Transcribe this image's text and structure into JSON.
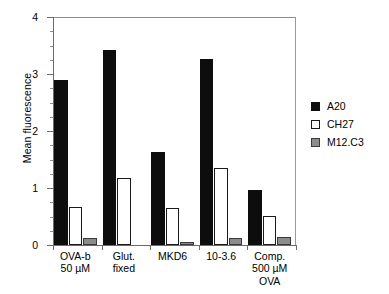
{
  "chart_data": {
    "type": "bar",
    "title": "",
    "xlabel": "",
    "ylabel": "Mean fluorescence",
    "ylim": [
      0,
      4
    ],
    "yticks": [
      0,
      1,
      2,
      3,
      4
    ],
    "ytick_labels": [
      "0",
      "1",
      "2",
      "3",
      "4"
    ],
    "yminor_step": 0.25,
    "grid": false,
    "legend_position": "right",
    "categories": [
      "OVA-b\n50 µM",
      "Glut.\nfixed",
      "MKD6",
      "10-3.6",
      "Comp.\n500 µM\nOVA"
    ],
    "category_lines": [
      [
        "OVA-b",
        "50 µM"
      ],
      [
        "Glut.",
        "fixed"
      ],
      [
        "MKD6"
      ],
      [
        "10-3.6"
      ],
      [
        "Comp.",
        "500 µM",
        "OVA"
      ]
    ],
    "series": [
      {
        "name": "A20",
        "color": "#0d0d0d",
        "values": [
          2.9,
          3.42,
          1.63,
          3.26,
          0.97
        ]
      },
      {
        "name": "CH27",
        "color": "#ffffff",
        "values": [
          0.67,
          1.17,
          0.65,
          1.35,
          0.51
        ]
      },
      {
        "name": "M12.C3",
        "color": "#8c8c8c",
        "values": [
          0.12,
          0.0,
          0.06,
          0.12,
          0.14
        ]
      }
    ]
  },
  "legend": {
    "items": [
      {
        "label": "A20"
      },
      {
        "label": "CH27"
      },
      {
        "label": "M12.C3"
      }
    ]
  },
  "axes": {
    "y_axis_title": "Mean fluorescence"
  }
}
